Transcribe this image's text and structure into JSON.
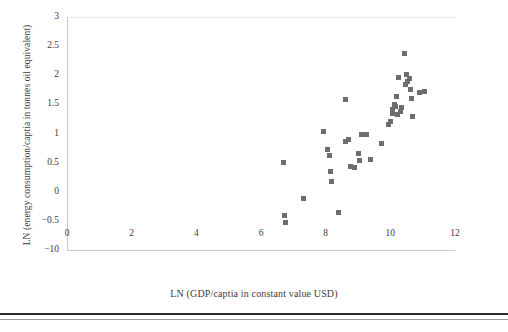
{
  "chart_data": {
    "type": "scatter",
    "title": "",
    "xlabel": "LN (GDP/captia in constant value USD)",
    "ylabel": "LN (energy consumption/captia in tonnes oil equivalent)",
    "xlim": [
      0,
      12
    ],
    "ylim": [
      -1,
      3
    ],
    "xticks": [
      "0",
      "2",
      "4",
      "6",
      "8",
      "10",
      "12"
    ],
    "xtick_values": [
      0,
      2,
      4,
      6,
      8,
      10,
      12
    ],
    "yticks": [
      "3",
      "2.5",
      "2",
      "1.5",
      "1",
      "0.5",
      "0",
      "-0.5",
      "-10"
    ],
    "ytick_values": [
      3,
      2.5,
      2,
      1.5,
      1,
      0.5,
      0,
      -0.5,
      -1
    ],
    "grid": false,
    "legend": null,
    "marker": "square",
    "marker_color": "#6d6d6d",
    "marker_size_px": 5,
    "points": [
      {
        "x": 6.7,
        "y": 0.5
      },
      {
        "x": 6.73,
        "y": -0.4
      },
      {
        "x": 6.76,
        "y": -0.52
      },
      {
        "x": 7.32,
        "y": -0.12
      },
      {
        "x": 7.94,
        "y": 1.03
      },
      {
        "x": 8.05,
        "y": 0.72
      },
      {
        "x": 8.12,
        "y": 0.62
      },
      {
        "x": 8.15,
        "y": 0.35
      },
      {
        "x": 8.18,
        "y": 0.18
      },
      {
        "x": 8.4,
        "y": -0.36
      },
      {
        "x": 8.6,
        "y": 1.58
      },
      {
        "x": 8.62,
        "y": 0.86
      },
      {
        "x": 8.72,
        "y": 0.9
      },
      {
        "x": 8.76,
        "y": 0.44
      },
      {
        "x": 8.9,
        "y": 0.42
      },
      {
        "x": 9.02,
        "y": 0.66
      },
      {
        "x": 9.05,
        "y": 0.53
      },
      {
        "x": 9.12,
        "y": 0.98
      },
      {
        "x": 9.25,
        "y": 0.99
      },
      {
        "x": 9.38,
        "y": 0.55
      },
      {
        "x": 9.72,
        "y": 0.82
      },
      {
        "x": 9.95,
        "y": 1.16
      },
      {
        "x": 10.02,
        "y": 1.2
      },
      {
        "x": 10.06,
        "y": 1.34
      },
      {
        "x": 10.08,
        "y": 1.41
      },
      {
        "x": 10.12,
        "y": 1.5
      },
      {
        "x": 10.16,
        "y": 1.46
      },
      {
        "x": 10.2,
        "y": 1.63
      },
      {
        "x": 10.22,
        "y": 1.32
      },
      {
        "x": 10.25,
        "y": 1.96
      },
      {
        "x": 10.32,
        "y": 1.38
      },
      {
        "x": 10.36,
        "y": 1.44
      },
      {
        "x": 10.44,
        "y": 2.38
      },
      {
        "x": 10.46,
        "y": 1.84
      },
      {
        "x": 10.5,
        "y": 2.02
      },
      {
        "x": 10.54,
        "y": 1.9
      },
      {
        "x": 10.58,
        "y": 1.95
      },
      {
        "x": 10.62,
        "y": 1.76
      },
      {
        "x": 10.66,
        "y": 1.6
      },
      {
        "x": 10.7,
        "y": 1.3
      },
      {
        "x": 10.9,
        "y": 1.7
      },
      {
        "x": 11.05,
        "y": 1.72
      }
    ]
  }
}
